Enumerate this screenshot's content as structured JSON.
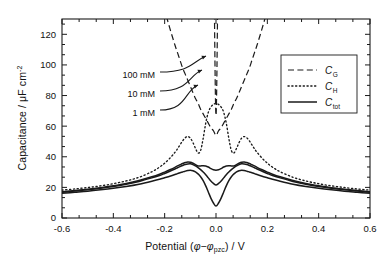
{
  "figure": {
    "kind": "scientific-plot",
    "background": "#ffffff",
    "line_color": "#1a1a1a"
  },
  "axes": {
    "x": {
      "label_prefix": "Potential (",
      "label_phi": "φ",
      "label_minus": "−",
      "label_phi2": "φ",
      "label_sub": "pzc",
      "label_suffix": ") / V",
      "min": -0.6,
      "max": 0.6,
      "ticks": [
        -0.6,
        -0.4,
        -0.2,
        0.0,
        0.2,
        0.4,
        0.6
      ],
      "tick_labels": [
        "-0.6",
        "-0.4",
        "-0.2",
        "0.0",
        "0.2",
        "0.4",
        "0.6"
      ],
      "minor_per_major": 2
    },
    "y": {
      "label_prefix": "Capacitance / ",
      "label_mu": "μ",
      "label_unit": "F cm",
      "label_exp": "-2",
      "min": 0,
      "max": 130,
      "ticks": [
        0,
        20,
        40,
        60,
        80,
        100,
        120
      ],
      "tick_labels": [
        "0",
        "20",
        "40",
        "60",
        "80",
        "100",
        "120"
      ],
      "minor_per_major": 2
    }
  },
  "legend": {
    "position": "upper-right",
    "entries": [
      {
        "label_base": "C",
        "label_sub": "G",
        "style": "dashed"
      },
      {
        "label_base": "C",
        "label_sub": "H",
        "style": "dotted"
      },
      {
        "label_base": "C",
        "label_sub": "tot",
        "style": "solid"
      }
    ]
  },
  "annotations": [
    {
      "text": "100 mM",
      "x_text": 0.0,
      "y_text": 103,
      "x_tip": 0.0,
      "y_tip": 103
    },
    {
      "text": "10 mM",
      "x_text": 0.0,
      "y_text": 94,
      "x_tip": 0.0,
      "y_tip": 94
    },
    {
      "text": "1 mM",
      "x_text": 0.0,
      "y_text": 85,
      "x_tip": 0.0,
      "y_tip": 85
    }
  ],
  "chart_data": {
    "type": "line",
    "title": "",
    "xlabel": "Potential (φ−φpzc) / V",
    "ylabel": "Capacitance / μF cm-2",
    "xlim": [
      -0.6,
      0.6
    ],
    "ylim": [
      0,
      130
    ],
    "grid": false,
    "legend_position": "upper-right",
    "x": [
      -0.6,
      -0.55,
      -0.5,
      -0.45,
      -0.4,
      -0.35,
      -0.3,
      -0.25,
      -0.22,
      -0.2,
      -0.18,
      -0.16,
      -0.15,
      -0.14,
      -0.13,
      -0.12,
      -0.11,
      -0.1,
      -0.09,
      -0.08,
      -0.07,
      -0.06,
      -0.05,
      -0.04,
      -0.03,
      -0.02,
      -0.01,
      0.0,
      0.01,
      0.02,
      0.03,
      0.04,
      0.05,
      0.06,
      0.07,
      0.08,
      0.09,
      0.1,
      0.11,
      0.12,
      0.13,
      0.14,
      0.15,
      0.16,
      0.18,
      0.2,
      0.22,
      0.25,
      0.3,
      0.35,
      0.4,
      0.45,
      0.5,
      0.55,
      0.6
    ],
    "series": [
      {
        "name": "C_H",
        "label": "C_H",
        "style": "dotted",
        "concentration": null,
        "values": [
          18.2,
          19.0,
          19.9,
          21.0,
          22.4,
          24.2,
          26.6,
          30.2,
          33.2,
          35.8,
          39.0,
          42.9,
          45.2,
          47.8,
          50.4,
          52.4,
          53.2,
          52.2,
          49.3,
          45.5,
          42.5,
          44.0,
          52.0,
          62.0,
          69.0,
          72.5,
          74.2,
          74.8,
          74.2,
          72.5,
          69.0,
          62.0,
          52.0,
          44.0,
          42.5,
          45.5,
          49.3,
          52.2,
          53.2,
          52.4,
          50.4,
          47.8,
          45.2,
          42.9,
          39.0,
          35.8,
          33.2,
          30.2,
          26.6,
          24.2,
          22.4,
          21.0,
          19.9,
          19.0,
          18.2
        ]
      },
      {
        "name": "C_G_1mM",
        "label": "C_G",
        "style": "dashed",
        "concentration": "1 mM",
        "values": [
          600,
          520,
          450,
          380,
          320,
          265,
          215,
          172,
          150,
          136,
          124,
          113,
          108,
          103,
          98,
          94,
          90,
          86,
          82,
          78,
          75,
          71,
          68,
          65,
          62,
          59,
          57,
          54,
          57,
          59,
          62,
          65,
          68,
          71,
          75,
          78,
          82,
          86,
          90,
          94,
          98,
          103,
          108,
          113,
          124,
          136,
          150,
          172,
          215,
          265,
          320,
          380,
          450,
          520,
          600
        ]
      },
      {
        "name": "C_G_10mM",
        "label": "C_G",
        "style": "dashed",
        "concentration": "10 mM",
        "values": [
          1900,
          1650,
          1420,
          1200,
          1010,
          840,
          680,
          545,
          475,
          430,
          392,
          357,
          341,
          325,
          310,
          296,
          283,
          271,
          259,
          247,
          237,
          227,
          217,
          208,
          199,
          190,
          182,
          67,
          182,
          190,
          199,
          208,
          217,
          227,
          237,
          247,
          259,
          271,
          283,
          296,
          310,
          325,
          341,
          357,
          392,
          430,
          475,
          545,
          680,
          840,
          1010,
          1200,
          1420,
          1650,
          1900
        ]
      },
      {
        "name": "C_G_100mM",
        "label": "C_G",
        "style": "dashed",
        "concentration": "100 mM",
        "values": [
          6000,
          5200,
          4480,
          3800,
          3200,
          2660,
          2150,
          1720,
          1500,
          1360,
          1240,
          1130,
          1078,
          1030,
          982,
          936,
          893,
          852,
          812,
          774,
          738,
          704,
          671,
          640,
          609,
          580,
          552,
          74,
          552,
          580,
          609,
          640,
          671,
          704,
          738,
          774,
          812,
          852,
          893,
          936,
          982,
          1030,
          1078,
          1130,
          1240,
          1360,
          1500,
          1720,
          2150,
          2660,
          3200,
          3800,
          4480,
          5200,
          6000
        ]
      },
      {
        "name": "C_tot_1mM",
        "label": "C_tot",
        "style": "solid",
        "concentration": "1 mM",
        "values": [
          16.1,
          16.8,
          17.5,
          18.4,
          19.4,
          20.6,
          22.1,
          24.0,
          25.3,
          26.3,
          27.3,
          28.4,
          29.0,
          29.6,
          30.1,
          30.6,
          31.0,
          31.2,
          30.9,
          30.1,
          28.8,
          27.0,
          24.4,
          21.0,
          17.0,
          13.0,
          9.8,
          7.8,
          9.8,
          13.0,
          17.0,
          21.0,
          24.4,
          27.0,
          28.8,
          30.1,
          30.9,
          31.2,
          31.0,
          30.6,
          30.1,
          29.6,
          29.0,
          28.4,
          27.3,
          26.3,
          25.3,
          24.0,
          22.1,
          20.6,
          19.4,
          18.4,
          17.5,
          16.8,
          16.1
        ]
      },
      {
        "name": "C_tot_10mM",
        "label": "C_tot",
        "style": "solid",
        "concentration": "10 mM",
        "values": [
          16.8,
          17.6,
          18.4,
          19.4,
          20.6,
          22.1,
          23.9,
          26.2,
          27.8,
          29.1,
          30.5,
          32.0,
          32.8,
          33.6,
          34.3,
          34.9,
          35.3,
          35.4,
          34.9,
          34.0,
          32.9,
          31.6,
          30.0,
          28.2,
          26.2,
          24.2,
          22.6,
          21.6,
          22.6,
          24.2,
          26.2,
          28.2,
          30.0,
          31.6,
          32.9,
          34.0,
          34.9,
          35.4,
          35.3,
          34.9,
          34.3,
          33.6,
          32.8,
          32.0,
          30.5,
          29.1,
          27.8,
          26.2,
          23.9,
          22.1,
          20.6,
          19.4,
          18.4,
          17.6,
          16.8
        ]
      },
      {
        "name": "C_tot_100mM",
        "label": "C_tot",
        "style": "solid",
        "concentration": "100 mM",
        "values": [
          17.1,
          17.9,
          18.8,
          19.8,
          21.1,
          22.6,
          24.5,
          26.9,
          28.6,
          30.0,
          31.5,
          33.1,
          34.0,
          34.8,
          35.6,
          36.2,
          36.6,
          36.4,
          35.8,
          34.9,
          34.0,
          34.0,
          34.2,
          34.0,
          33.3,
          32.3,
          31.5,
          31.2,
          31.5,
          32.3,
          33.3,
          34.0,
          34.2,
          34.0,
          34.0,
          34.9,
          35.8,
          36.4,
          36.6,
          36.2,
          35.6,
          34.8,
          34.0,
          33.1,
          31.5,
          30.0,
          28.6,
          26.9,
          24.5,
          22.6,
          21.1,
          19.8,
          18.8,
          17.9,
          17.1
        ]
      }
    ]
  }
}
